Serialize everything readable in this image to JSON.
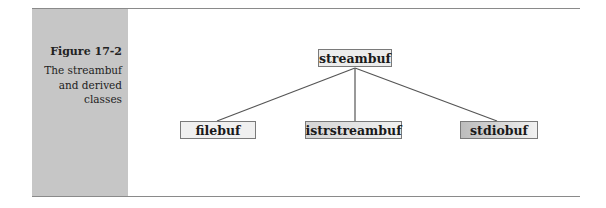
{
  "figure": {
    "label": "Figure 17-2",
    "title_lines": [
      "The streambuf",
      "and derived",
      "classes"
    ]
  },
  "diagram": {
    "root": {
      "id": "streambuf",
      "label": "streambuf"
    },
    "children": [
      {
        "id": "filebuf",
        "label": "filebuf"
      },
      {
        "id": "istrstreambuf",
        "label": "istrstreambuf"
      },
      {
        "id": "stdiobuf",
        "label": "stdiobuf"
      }
    ],
    "edges": [
      {
        "from": "streambuf",
        "to": "filebuf"
      },
      {
        "from": "streambuf",
        "to": "istrstreambuf"
      },
      {
        "from": "streambuf",
        "to": "stdiobuf"
      }
    ]
  },
  "colors": {
    "sidebar": "#c6c6c6",
    "rule": "#8a8a8a",
    "line": "#555555"
  }
}
